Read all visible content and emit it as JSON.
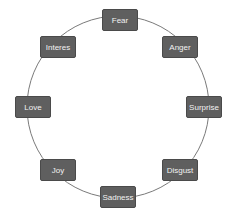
{
  "diagram": {
    "type": "cycle",
    "colors": {
      "node_fill": "#5f5f5f",
      "node_text": "#f2f2f2",
      "ring": "#7a7a7a"
    },
    "nodes": [
      {
        "label": "Fear",
        "x": 102,
        "y": 9
      },
      {
        "label": "Anger",
        "x": 162,
        "y": 36
      },
      {
        "label": "Surprise",
        "x": 186,
        "y": 96
      },
      {
        "label": "Disgust",
        "x": 162,
        "y": 159
      },
      {
        "label": "Sadness",
        "x": 100,
        "y": 186
      },
      {
        "label": "Joy",
        "x": 40,
        "y": 159
      },
      {
        "label": "Love",
        "x": 15,
        "y": 96
      },
      {
        "label": "Interes",
        "x": 40,
        "y": 36
      }
    ]
  }
}
